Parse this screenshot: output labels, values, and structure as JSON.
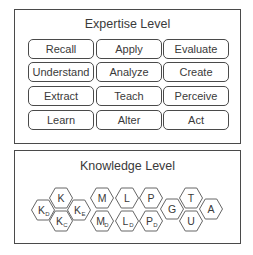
{
  "expertise": {
    "title": "Expertise Level",
    "buttons": [
      [
        "Recall",
        "Apply",
        "Evaluate"
      ],
      [
        "Understand",
        "Analyze",
        "Create"
      ],
      [
        "Extract",
        "Teach",
        "Perceive"
      ],
      [
        "Learn",
        "Alter",
        "Act"
      ]
    ]
  },
  "knowledge": {
    "title": "Knowledge Level",
    "hexagons": [
      {
        "label": "K",
        "sub": "D",
        "cx": 43,
        "cy": 210
      },
      {
        "label": "K",
        "sub": "",
        "cx": 61,
        "cy": 198
      },
      {
        "label": "K",
        "sub": "C",
        "cx": 61,
        "cy": 221
      },
      {
        "label": "K",
        "sub": "E",
        "cx": 79,
        "cy": 210
      },
      {
        "label": "M",
        "sub": "",
        "cx": 102,
        "cy": 198
      },
      {
        "label": "M",
        "sub": "D",
        "cx": 102,
        "cy": 221
      },
      {
        "label": "L",
        "sub": "",
        "cx": 127,
        "cy": 198
      },
      {
        "label": "L",
        "sub": "D",
        "cx": 127,
        "cy": 221
      },
      {
        "label": "P",
        "sub": "",
        "cx": 151,
        "cy": 198
      },
      {
        "label": "P",
        "sub": "D",
        "cx": 151,
        "cy": 221
      },
      {
        "label": "G",
        "sub": "",
        "cx": 172,
        "cy": 209
      },
      {
        "label": "T",
        "sub": "",
        "cx": 191,
        "cy": 198
      },
      {
        "label": "U",
        "sub": "",
        "cx": 191,
        "cy": 221
      },
      {
        "label": "A",
        "sub": "",
        "cx": 211,
        "cy": 209
      }
    ]
  }
}
